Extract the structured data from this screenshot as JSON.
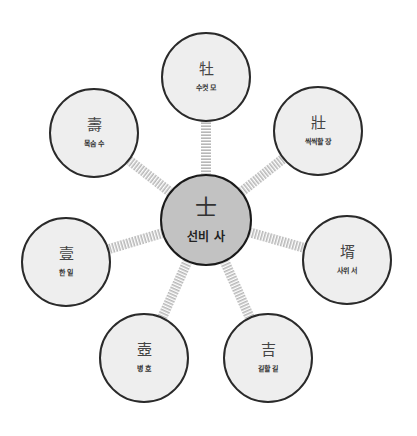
{
  "diagram": {
    "type": "radial-mindmap",
    "colors": {
      "center_fill": "#c2c2c2",
      "node_fill": "#eeeeee",
      "border": "#2a2a2a",
      "connector": "#bbbbbb"
    },
    "center": {
      "hanja": "士",
      "meaning": "선비 사",
      "x": 206,
      "y": 220,
      "r": 46
    },
    "nodes": [
      {
        "hanja": "牡",
        "meaning": "수컷 모",
        "x": 206,
        "y": 77,
        "r": 45
      },
      {
        "hanja": "壯",
        "meaning": "씩씩할 장",
        "x": 318,
        "y": 131,
        "r": 45
      },
      {
        "hanja": "壻",
        "meaning": "사위 서",
        "x": 347,
        "y": 260,
        "r": 45
      },
      {
        "hanja": "吉",
        "meaning": "길할 길",
        "x": 268,
        "y": 358,
        "r": 45
      },
      {
        "hanja": "壺",
        "meaning": "병 호",
        "x": 144,
        "y": 358,
        "r": 45
      },
      {
        "hanja": "壹",
        "meaning": "한 일",
        "x": 66,
        "y": 262,
        "r": 45
      },
      {
        "hanja": "壽",
        "meaning": "목숨 수",
        "x": 94,
        "y": 133,
        "r": 45
      }
    ]
  }
}
